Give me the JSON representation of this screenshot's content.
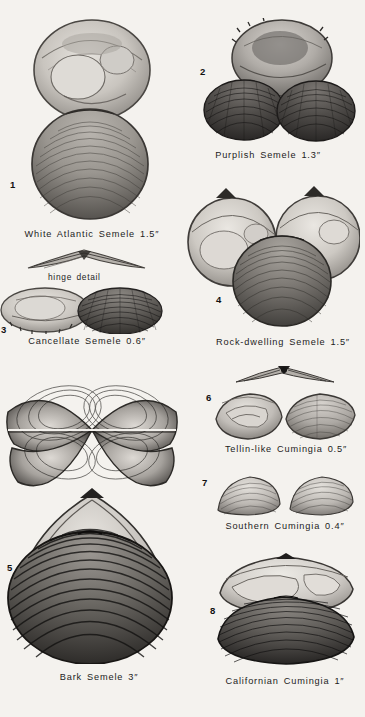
{
  "plate": {
    "background_color": "#f4f2ee",
    "ink_color": "#1c1c1c",
    "width": 365,
    "height": 717
  },
  "figures": [
    {
      "marker": "1",
      "caption": "White Atlantic Semele 1.5″",
      "icon": "bivalve-shell-pair-icon",
      "marker_x": 10,
      "marker_y": 179,
      "caption_x": 17,
      "caption_y": 229,
      "caption_w": 150
    },
    {
      "marker": "2",
      "caption": "Purplish Semele 1.3″",
      "icon": "bivalve-shell-trio-icon",
      "marker_x": 200,
      "marker_y": 66,
      "caption_x": 203,
      "caption_y": 150,
      "caption_w": 130
    },
    {
      "marker": "3",
      "caption": "Cancellate Semele 0.6″",
      "icon": "bivalve-shell-pair-small-icon",
      "marker_x": 1,
      "marker_y": 324,
      "caption_x": 14,
      "caption_y": 336,
      "caption_w": 146
    },
    {
      "marker": "4",
      "caption": "Rock-dwelling Semele 1.5″",
      "icon": "bivalve-shell-cluster-icon",
      "marker_x": 216,
      "marker_y": 294,
      "caption_x": 208,
      "caption_y": 337,
      "caption_w": 150
    },
    {
      "marker": "5",
      "caption": "Bark Semele 3″",
      "icon": "bivalve-shell-large-icon",
      "marker_x": 7,
      "marker_y": 562,
      "caption_x": 44,
      "caption_y": 672,
      "caption_w": 110
    },
    {
      "marker": "6",
      "caption": "Tellin-like Cumingia 0.5″",
      "icon": "cumingia-pair-icon",
      "marker_x": 206,
      "marker_y": 392,
      "caption_x": 216,
      "caption_y": 444,
      "caption_w": 140
    },
    {
      "marker": "7",
      "caption": "Southern Cumingia 0.4″",
      "icon": "cumingia-pair-small-icon",
      "marker_x": 202,
      "marker_y": 477,
      "caption_x": 218,
      "caption_y": 521,
      "caption_w": 134
    },
    {
      "marker": "8",
      "caption": "Californian Cumingia 1″",
      "icon": "cumingia-large-pair-icon",
      "marker_x": 210,
      "marker_y": 605,
      "caption_x": 221,
      "caption_y": 676,
      "caption_w": 128
    }
  ],
  "detail_labels": [
    {
      "text": "hinge detail",
      "icon": "hinge-detail-icon",
      "x": 48,
      "y": 272
    }
  ]
}
